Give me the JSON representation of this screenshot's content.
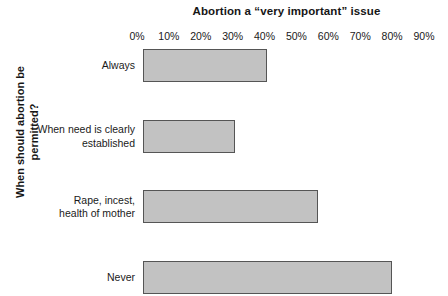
{
  "chart_data": {
    "type": "bar",
    "orientation": "horizontal",
    "title": "Abortion a “very important” issue",
    "xlabel": "",
    "ylabel": "When should abortion be permitted?",
    "ylabel_lines": [
      "When should abortion be",
      "permitted?"
    ],
    "categories": [
      "Always",
      "When need is clearly established",
      "Rape, incest, health of mother",
      "Never"
    ],
    "category_lines": [
      [
        "Always"
      ],
      [
        "When need is clearly",
        "established"
      ],
      [
        "Rape, incest,",
        "health of mother"
      ],
      [
        "Never"
      ]
    ],
    "values": [
      39,
      29,
      55,
      78
    ],
    "value_unit": "%",
    "xlim": [
      0,
      90
    ],
    "xticks": [
      0,
      10,
      20,
      30,
      40,
      50,
      60,
      70,
      80,
      90
    ],
    "xtick_labels": [
      "0%",
      "10%",
      "20%",
      "30%",
      "40%",
      "50%",
      "60%",
      "70%",
      "80%",
      "90%"
    ],
    "grid": false,
    "legend": null,
    "bar_fill_color": "#c2c2c2",
    "bar_border_color": "#555555",
    "background_color": "#ffffff"
  }
}
